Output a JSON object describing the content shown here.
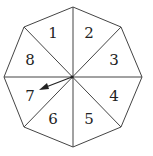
{
  "diagram": {
    "type": "spinner",
    "shape": "octagon",
    "sections": [
      {
        "label": "1",
        "x": 53,
        "y": 38
      },
      {
        "label": "2",
        "x": 89,
        "y": 38
      },
      {
        "label": "3",
        "x": 114,
        "y": 65
      },
      {
        "label": "4",
        "x": 114,
        "y": 101
      },
      {
        "label": "5",
        "x": 89,
        "y": 124
      },
      {
        "label": "6",
        "x": 53,
        "y": 124
      },
      {
        "label": "7",
        "x": 30,
        "y": 101
      },
      {
        "label": "8",
        "x": 30,
        "y": 65
      }
    ],
    "arrow": {
      "points_to": "7"
    },
    "colors": {
      "stroke": "#444444",
      "background": "#ffffff"
    }
  }
}
